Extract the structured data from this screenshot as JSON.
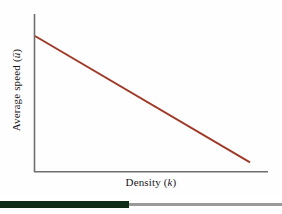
{
  "figure": {
    "name": "average-speed-vs-density-plot",
    "background_color": "#fefefe"
  },
  "axes": {
    "color": "#6e6e6e",
    "x_label_text": "Density (",
    "x_label_symbol": "k",
    "x_label_close": ")",
    "y_label_text": "Average speed (",
    "y_label_symbol": "ū",
    "y_label_close": ")"
  },
  "footer": {
    "tab_color": "#0d2b17",
    "rule_color": "#9a9a9a"
  },
  "chart_data": {
    "type": "line",
    "title": "",
    "subtitle": "",
    "xlabel": "Density (k)",
    "ylabel": "Average speed (ū)",
    "xlim": [
      0,
      1
    ],
    "ylim": [
      0,
      1
    ],
    "grid": false,
    "legend": null,
    "axis_ticks": {
      "x": [],
      "y": []
    },
    "series": [
      {
        "name": "Greenshields linear speed-density relation",
        "color": "#a03a28",
        "linewidth": 2,
        "x": [
          0.0,
          1.0
        ],
        "y": [
          1.0,
          0.035
        ],
        "annotation": "Average speed decreases linearly as density increases"
      }
    ]
  }
}
